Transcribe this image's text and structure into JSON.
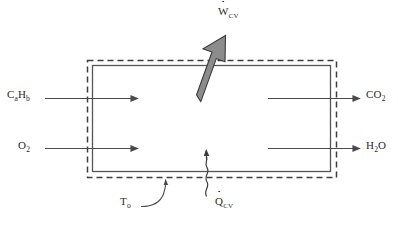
{
  "figure": {
    "name": "control-volume-combustion-diagram",
    "type": "thermodynamics-schematic",
    "colors": {
      "line": "#4a4a4a",
      "boundary_dashed": "#3d3d3d",
      "reactor_solid": "#555555",
      "work_arrow_fill": "#8c8c8c",
      "work_arrow_stroke": "#3a3a3a",
      "text": "#2a2a2a",
      "background": "#ffffff"
    }
  },
  "inlets": [
    {
      "id": "fuel",
      "formula_base_1": "C",
      "formula_sub_1": "a",
      "formula_base_2": "H",
      "formula_sub_2": "b",
      "plain": "CaHb",
      "arrow": "inlet-arrow-fuel"
    },
    {
      "id": "oxygen",
      "formula_base_1": "O",
      "formula_sub_1": "2",
      "plain": "O2",
      "arrow": "inlet-arrow-oxygen"
    }
  ],
  "outlets": [
    {
      "id": "carbon-dioxide",
      "formula_base_1": "CO",
      "formula_sub_1": "2",
      "plain": "CO2",
      "arrow": "outlet-arrow-co2"
    },
    {
      "id": "water",
      "formula_base_1": "H",
      "formula_sub_1": "2",
      "formula_base_2": "O",
      "plain": "H2O",
      "arrow": "outlet-arrow-h2o"
    }
  ],
  "energy_transfers": [
    {
      "id": "work",
      "symbol": "W",
      "subscript": "CV",
      "rate_dot": true,
      "plain": "W_cv",
      "direction": "out-upper-right",
      "style": "thick-block-arrow"
    },
    {
      "id": "heat",
      "symbol": "Q",
      "subscript": "CV",
      "rate_dot": true,
      "plain": "Q_cv",
      "direction": "out-upward",
      "style": "wavy-arrow"
    }
  ],
  "annotations": [
    {
      "id": "ambient-temperature",
      "symbol": "T",
      "subscript": "o",
      "plain": "To",
      "leader": "curved-arrow-to-boundary"
    }
  ],
  "boundary": {
    "id": "control-volume-boundary",
    "style": "dashed",
    "label_ref": "To"
  },
  "reactor": {
    "id": "reactor-body",
    "style": "solid-rectangle"
  }
}
